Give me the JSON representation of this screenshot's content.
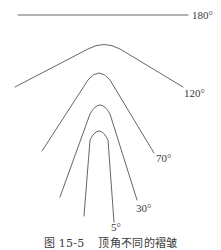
{
  "figure": {
    "caption_number": "图 15-5",
    "caption_title": "顶角不同的褶皱",
    "stroke_color": "#555555",
    "folds": [
      {
        "angle": 180,
        "label": "180°",
        "label_pos": {
          "x": 192,
          "y": 10
        }
      },
      {
        "angle": 120,
        "label": "120°",
        "label_pos": {
          "x": 184,
          "y": 87
        }
      },
      {
        "angle": 70,
        "label": "70°",
        "label_pos": {
          "x": 156,
          "y": 151
        }
      },
      {
        "angle": 30,
        "label": "30°",
        "label_pos": {
          "x": 136,
          "y": 201
        }
      },
      {
        "angle": 5,
        "label": "5°",
        "label_pos": {
          "x": 111,
          "y": 220
        }
      }
    ]
  }
}
